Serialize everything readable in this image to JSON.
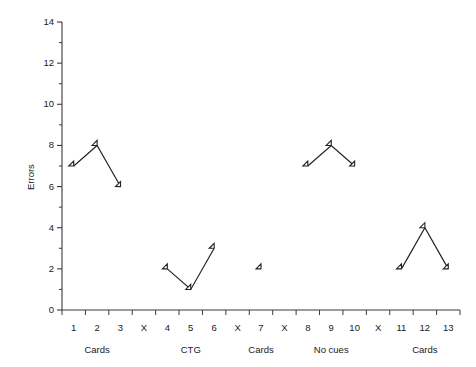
{
  "chart_data": {
    "type": "line",
    "title": "",
    "subtitle": "",
    "xlabel": "",
    "ylabel": "Errors",
    "ylim": [
      0,
      14
    ],
    "y_ticks": [
      0,
      2,
      4,
      6,
      8,
      10,
      12,
      14
    ],
    "y_minor_ticks": [
      1,
      3,
      5,
      7,
      9,
      11,
      13
    ],
    "grid": false,
    "legend": null,
    "x_tick_labels": [
      "1",
      "2",
      "3",
      "X",
      "4",
      "5",
      "6",
      "X",
      "7",
      "X",
      "8",
      "9",
      "10",
      "X",
      "11",
      "12",
      "13"
    ],
    "group_labels": [
      "Cards",
      "CTG",
      "Cards",
      "No cues",
      "Cards"
    ],
    "series": [
      {
        "name": "Cards",
        "group_label": "Cards",
        "x": [
          "1",
          "2",
          "3"
        ],
        "x_slots": [
          0,
          1,
          2
        ],
        "values": [
          7,
          8,
          6
        ]
      },
      {
        "name": "CTG",
        "group_label": "CTG",
        "x": [
          "4",
          "5",
          "6"
        ],
        "x_slots": [
          4,
          5,
          6
        ],
        "values": [
          2,
          1,
          3
        ]
      },
      {
        "name": "Cards 2",
        "group_label": "Cards",
        "x": [
          "7"
        ],
        "x_slots": [
          8
        ],
        "values": [
          2
        ]
      },
      {
        "name": "No cues",
        "group_label": "No cues",
        "x": [
          "8",
          "9",
          "10"
        ],
        "x_slots": [
          10,
          11,
          12
        ],
        "values": [
          7,
          8,
          7
        ]
      },
      {
        "name": "Cards 3",
        "group_label": "Cards",
        "x": [
          "11",
          "12",
          "13"
        ],
        "x_slots": [
          14,
          15,
          16
        ],
        "values": [
          2,
          4,
          2
        ]
      }
    ],
    "marker": "open-diamond",
    "colors": {
      "line": "#232323",
      "marker_fill": "#ffffff",
      "marker_stroke": "#232323",
      "axis": "#3a3a3a",
      "text": "#1a1a1a",
      "background": "#ffffff"
    }
  }
}
